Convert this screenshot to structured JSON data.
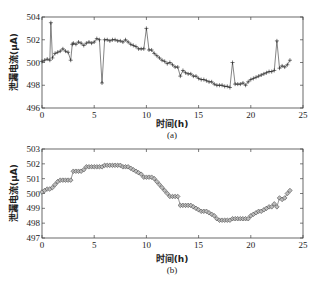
{
  "chart_data": [
    {
      "type": "line",
      "panel_label": "(a)",
      "xlabel": "时间(h)",
      "ylabel": "泄漏电流(μA)",
      "xlim": [
        0,
        25
      ],
      "ylim": [
        496,
        504
      ],
      "xticks": [
        0,
        5,
        10,
        15,
        20,
        25
      ],
      "yticks": [
        496,
        498,
        500,
        502,
        504
      ],
      "marker": "+",
      "grid": false,
      "series": [
        {
          "name": "raw",
          "x": [
            0,
            0.25,
            0.5,
            0.75,
            0.85,
            1.0,
            1.25,
            1.5,
            1.75,
            2.0,
            2.25,
            2.5,
            2.75,
            2.9,
            3.0,
            3.25,
            3.5,
            3.75,
            4.0,
            4.25,
            4.5,
            4.75,
            5.0,
            5.25,
            5.5,
            5.75,
            6.0,
            6.25,
            6.5,
            6.75,
            7.0,
            7.25,
            7.5,
            7.75,
            8.0,
            8.25,
            8.5,
            8.75,
            9.0,
            9.25,
            9.5,
            9.75,
            10.0,
            10.25,
            10.5,
            10.75,
            11.0,
            11.25,
            11.5,
            11.75,
            12.0,
            12.25,
            12.5,
            12.75,
            13.0,
            13.25,
            13.5,
            13.75,
            14.0,
            14.25,
            14.5,
            14.75,
            15.0,
            15.25,
            15.5,
            15.75,
            16.0,
            16.25,
            16.5,
            16.75,
            17.0,
            17.25,
            17.5,
            17.75,
            18.0,
            18.25,
            18.5,
            18.75,
            19.0,
            19.25,
            19.5,
            19.75,
            20.0,
            20.25,
            20.5,
            20.75,
            21.0,
            21.25,
            21.5,
            21.75,
            22.0,
            22.25,
            22.5,
            22.75,
            23.0,
            23.25,
            23.5,
            23.75
          ],
          "y": [
            500.1,
            500.2,
            500.3,
            500.2,
            503.5,
            500.4,
            500.8,
            500.9,
            501.0,
            501.2,
            501.0,
            500.9,
            500.2,
            501.6,
            501.7,
            501.6,
            501.8,
            501.7,
            501.5,
            501.7,
            501.8,
            501.7,
            501.8,
            502.1,
            502.0,
            498.2,
            502.0,
            502.0,
            501.9,
            502.0,
            502.0,
            501.9,
            501.9,
            501.8,
            502.0,
            501.8,
            501.6,
            501.5,
            501.4,
            501.2,
            501.2,
            501.2,
            503.0,
            501.1,
            501.1,
            500.8,
            500.6,
            500.4,
            500.2,
            500.1,
            499.9,
            500.0,
            499.8,
            499.6,
            499.6,
            498.8,
            499.3,
            499.1,
            499.0,
            499.0,
            498.8,
            498.8,
            498.6,
            498.5,
            498.5,
            498.4,
            498.3,
            498.3,
            498.1,
            498.0,
            498.0,
            498.0,
            497.9,
            497.9,
            497.8,
            500.0,
            498.1,
            498.1,
            498.1,
            498.2,
            498.0,
            498.3,
            498.5,
            498.6,
            498.7,
            498.8,
            498.9,
            499.0,
            499.1,
            499.2,
            499.2,
            499.3,
            501.9,
            499.5,
            499.7,
            499.6,
            499.8,
            500.2
          ]
        }
      ]
    },
    {
      "type": "scatter",
      "panel_label": "(b)",
      "xlabel": "时间(h)",
      "ylabel": "泄漏电流(μA)",
      "xlim": [
        0,
        25
      ],
      "ylim": [
        497,
        503
      ],
      "xticks": [
        0,
        5,
        10,
        15,
        20,
        25
      ],
      "yticks": [
        497,
        498,
        499,
        500,
        501,
        502,
        503
      ],
      "marker": "diamond",
      "grid": false,
      "series": [
        {
          "name": "filtered",
          "x": [
            0,
            0.25,
            0.5,
            0.75,
            1.0,
            1.25,
            1.5,
            1.75,
            2.0,
            2.25,
            2.5,
            2.75,
            3.0,
            3.25,
            3.5,
            3.75,
            4.0,
            4.25,
            4.5,
            4.75,
            5.0,
            5.25,
            5.5,
            5.75,
            6.0,
            6.25,
            6.5,
            6.75,
            7.0,
            7.25,
            7.5,
            7.75,
            8.0,
            8.25,
            8.5,
            8.75,
            9.0,
            9.25,
            9.5,
            9.75,
            10.0,
            10.25,
            10.5,
            10.75,
            11.0,
            11.25,
            11.5,
            11.75,
            12.0,
            12.25,
            12.5,
            12.75,
            13.0,
            13.25,
            13.5,
            13.75,
            14.0,
            14.25,
            14.5,
            14.75,
            15.0,
            15.25,
            15.5,
            15.75,
            16.0,
            16.25,
            16.5,
            16.75,
            17.0,
            17.25,
            17.5,
            17.75,
            18.0,
            18.25,
            18.5,
            18.75,
            19.0,
            19.25,
            19.5,
            19.75,
            20.0,
            20.25,
            20.5,
            20.75,
            21.0,
            21.25,
            21.5,
            21.75,
            22.0,
            22.25,
            22.5,
            22.75,
            23.0,
            23.25,
            23.5,
            23.75
          ],
          "y": [
            500.1,
            500.2,
            500.3,
            500.3,
            500.4,
            500.6,
            500.8,
            500.9,
            500.9,
            500.9,
            500.9,
            500.9,
            501.5,
            501.5,
            501.5,
            501.5,
            501.6,
            501.8,
            501.8,
            501.8,
            501.8,
            501.8,
            501.8,
            501.8,
            501.9,
            501.9,
            501.9,
            501.9,
            501.9,
            501.9,
            501.9,
            501.8,
            501.8,
            501.8,
            501.7,
            501.6,
            501.5,
            501.4,
            501.3,
            501.1,
            501.1,
            501.1,
            501.1,
            501.0,
            500.8,
            500.6,
            500.4,
            500.2,
            500.0,
            499.8,
            499.8,
            499.8,
            499.8,
            499.2,
            499.2,
            499.2,
            499.2,
            499.2,
            499.1,
            499.0,
            498.9,
            498.8,
            498.8,
            498.8,
            498.7,
            498.6,
            498.5,
            498.3,
            498.2,
            498.2,
            498.2,
            498.2,
            498.2,
            498.3,
            498.3,
            498.3,
            498.3,
            498.3,
            498.3,
            498.3,
            498.5,
            498.6,
            498.7,
            498.8,
            498.8,
            498.9,
            499.0,
            499.1,
            499.1,
            499.3,
            499.1,
            499.7,
            499.6,
            499.7,
            500.0,
            500.2
          ]
        }
      ]
    }
  ],
  "labels": {
    "top": {
      "panel": "(a)",
      "xlabel": "时间(h)",
      "ylabel": "泄漏电流(μA)",
      "xticks": [
        "0",
        "5",
        "10",
        "15",
        "20",
        "25"
      ],
      "yticks": [
        "504",
        "502",
        "500",
        "498",
        "496"
      ]
    },
    "bottom": {
      "panel": "(b)",
      "xlabel": "时间(h)",
      "ylabel": "泄漏电流(μA)",
      "xticks": [
        "0",
        "5",
        "10",
        "15",
        "20",
        "25"
      ],
      "yticks": [
        "503",
        "502",
        "501",
        "500",
        "499",
        "498",
        "497"
      ]
    }
  },
  "colors": {
    "line": "#333333",
    "axis": "#444444",
    "marker_fill": "#bbbbbb"
  }
}
